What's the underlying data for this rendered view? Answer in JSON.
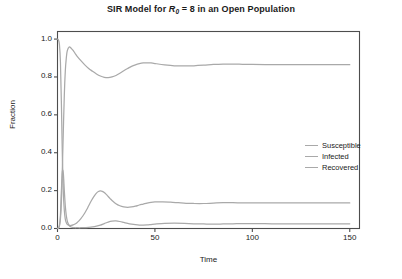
{
  "chart_data": {
    "type": "line",
    "title_parts": {
      "before": "SIR Model for ",
      "symbol": "R",
      "subscript": "0",
      "after": " = 8 in an Open Population"
    },
    "xlabel": "Time",
    "ylabel": "Fraction",
    "xlim": [
      0,
      155
    ],
    "ylim": [
      0.0,
      1.04
    ],
    "xticks": [
      0,
      50,
      100,
      150
    ],
    "xtick_labels": [
      "0",
      "50",
      "100",
      "150"
    ],
    "yticks": [
      0.0,
      0.2,
      0.4,
      0.6,
      0.8,
      1.0
    ],
    "ytick_labels": [
      "0.0",
      "0.2",
      "0.4",
      "0.6",
      "0.8",
      "1.0"
    ],
    "grid": false,
    "frame": true,
    "legend_position": "center right",
    "line_color": "#a9a9a9",
    "frame_color": "#4d4d4d",
    "series": [
      {
        "name": "Susceptible",
        "equilibrium": 0.135,
        "x": [
          0,
          0.5,
          1,
          1.5,
          2,
          2.5,
          3,
          3.5,
          4,
          4.5,
          5,
          6,
          7,
          8,
          9,
          10,
          11,
          12,
          13,
          14,
          15,
          16,
          17,
          18,
          19,
          20,
          21,
          22,
          23,
          24,
          25,
          26,
          27,
          28,
          30,
          32,
          34,
          36,
          38,
          40,
          42,
          44,
          46,
          48,
          50,
          54,
          58,
          62,
          66,
          70,
          75,
          80,
          85,
          90,
          95,
          100,
          110,
          120,
          130,
          140,
          150
        ],
        "y": [
          1.0,
          0.995,
          0.97,
          0.88,
          0.66,
          0.38,
          0.19,
          0.095,
          0.05,
          0.031,
          0.022,
          0.016,
          0.016,
          0.019,
          0.024,
          0.031,
          0.04,
          0.052,
          0.066,
          0.082,
          0.1,
          0.12,
          0.14,
          0.158,
          0.174,
          0.187,
          0.195,
          0.198,
          0.196,
          0.19,
          0.18,
          0.169,
          0.158,
          0.148,
          0.131,
          0.12,
          0.114,
          0.112,
          0.114,
          0.118,
          0.124,
          0.129,
          0.134,
          0.138,
          0.14,
          0.141,
          0.139,
          0.136,
          0.133,
          0.132,
          0.132,
          0.134,
          0.136,
          0.136,
          0.135,
          0.135,
          0.135,
          0.135,
          0.135,
          0.135,
          0.135
        ]
      },
      {
        "name": "Infected",
        "equilibrium": 0.025,
        "x": [
          0,
          0.5,
          1,
          1.5,
          2,
          2.5,
          3,
          3.5,
          4,
          4.5,
          5,
          5.5,
          6,
          7,
          8,
          9,
          10,
          12,
          14,
          16,
          18,
          20,
          22,
          24,
          26,
          28,
          30,
          32,
          34,
          36,
          38,
          40,
          42,
          44,
          46,
          48,
          50,
          55,
          60,
          65,
          70,
          75,
          80,
          85,
          90,
          95,
          100,
          110,
          120,
          130,
          140,
          150
        ],
        "y": [
          0.0005,
          0.003,
          0.016,
          0.07,
          0.2,
          0.3,
          0.29,
          0.2,
          0.12,
          0.07,
          0.04,
          0.025,
          0.016,
          0.008,
          0.005,
          0.004,
          0.004,
          0.004,
          0.005,
          0.006,
          0.008,
          0.012,
          0.018,
          0.026,
          0.034,
          0.039,
          0.04,
          0.037,
          0.032,
          0.027,
          0.023,
          0.02,
          0.018,
          0.018,
          0.019,
          0.021,
          0.023,
          0.027,
          0.028,
          0.027,
          0.025,
          0.024,
          0.023,
          0.024,
          0.025,
          0.026,
          0.026,
          0.025,
          0.025,
          0.025,
          0.025,
          0.025
        ]
      },
      {
        "name": "Recovered",
        "equilibrium": 0.865,
        "x": [
          0,
          0.5,
          1,
          1.5,
          2,
          2.5,
          3,
          3.5,
          4,
          4.5,
          5,
          6,
          7,
          8,
          9,
          10,
          12,
          14,
          16,
          18,
          20,
          22,
          24,
          26,
          28,
          30,
          32,
          34,
          36,
          38,
          40,
          42,
          44,
          46,
          48,
          50,
          55,
          60,
          65,
          70,
          75,
          80,
          85,
          90,
          95,
          100,
          110,
          120,
          130,
          140,
          150
        ],
        "y": [
          0.0,
          0.002,
          0.014,
          0.05,
          0.14,
          0.32,
          0.52,
          0.705,
          0.83,
          0.899,
          0.938,
          0.958,
          0.952,
          0.94,
          0.925,
          0.91,
          0.886,
          0.864,
          0.845,
          0.83,
          0.816,
          0.805,
          0.798,
          0.796,
          0.8,
          0.808,
          0.82,
          0.833,
          0.845,
          0.856,
          0.864,
          0.87,
          0.874,
          0.875,
          0.874,
          0.871,
          0.864,
          0.859,
          0.858,
          0.859,
          0.862,
          0.866,
          0.868,
          0.868,
          0.867,
          0.866,
          0.865,
          0.865,
          0.865,
          0.865,
          0.865
        ]
      }
    ],
    "legend": [
      "Susceptible",
      "Infected",
      "Recovered"
    ]
  }
}
